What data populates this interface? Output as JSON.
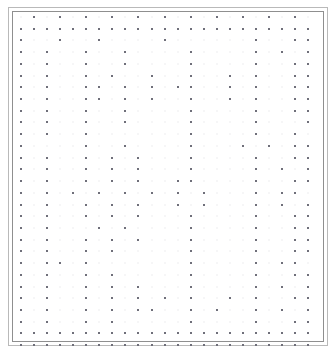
{
  "document": {
    "title": "Dot Grid Scan",
    "kind": "scanned-dot-grid-chart",
    "width": 335,
    "height": 363,
    "background_color": "#ffffff"
  },
  "frame": {
    "outer": {
      "x": 8,
      "y": 7,
      "width": 320,
      "height": 339,
      "color": "#b9b9b9",
      "thickness": 1
    },
    "inner": {
      "x": 12,
      "y": 11,
      "width": 312,
      "height": 331,
      "color": "#8f8f8f",
      "thickness": 1
    }
  },
  "dot_grid": {
    "origin_x": 20,
    "origin_y": 16,
    "step_x": 13.05,
    "step_y": 11.72,
    "columns": 23,
    "rows": 29,
    "dot_color": "#6f6f7a",
    "dot_size": 2,
    "ghost_color": "#c8c8d0",
    "notes": "Each row string has one character per column: '#' = dot present, '.' = dot absent.",
    "pattern": [
      ".#.#.#.#.#.#.#.#.#.#.#.",
      "#######################",
      "#..#..#....#......#..##",
      "#.#..#..#....#....#.#.#",
      "#.#..#..#....#....#..##",
      "#.#..#.#..#..#..#.#..##",
      "#.#..##.#.#.##..#.#..##",
      "#.#..##.#.#..#..#.#..##",
      "#.#..#..#....#....#..##",
      "#.#..#..#....#....#...#",
      "#.#..#.......#....#..#.",
      "#....#..#....#...#.#.##",
      "#.#..#.#.#...#....#..##",
      "#.#..#.#.#...#....#.#.#",
      "#.#..#.#.#..##....#..##",
      "#.#.#.#.#.#.#.#...#.##.",
      "#.#..#.#.#..#.#...#.#.#",
      "#.#..#.#.#...#....#..##",
      "#.#...#.#....#....#..##",
      "#.#..#.#.#...#....#..##",
      "#.#..#.#.....#....#..##",
      "#.##.#.......#....#.##.",
      "#.#..#.#.....#....#..##",
      "#.#..#.#.#...#....#.#.#",
      "#.#..#.#.#.#.#..#.#..##",
      "#.#..#.#.##..#.#..#.#.#",
      "#.#..#.#.....#....#..##",
      "#######################",
      "#######################"
    ]
  }
}
